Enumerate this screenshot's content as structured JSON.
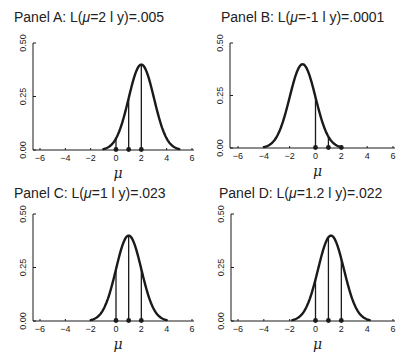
{
  "chart_data": [
    {
      "type": "line",
      "panel": "A",
      "title_prefix": "Panel A: L(",
      "title_mu": "μ",
      "title_suffix": "=2 l y)=.005",
      "mu": 2,
      "sigma": 1,
      "observations": [
        0,
        1,
        2
      ],
      "likelihood": ".005",
      "xlabel": "μ",
      "ylabel": "",
      "xlim": [
        -6,
        6
      ],
      "ylim": [
        0,
        0.5
      ],
      "xticks": [
        -6,
        -4,
        -2,
        0,
        2,
        4,
        6
      ],
      "yticks": [
        "0.00",
        "0.25",
        "0.50"
      ],
      "curve_range": [
        -1,
        5
      ]
    },
    {
      "type": "line",
      "panel": "B",
      "title_prefix": "Panel B: L(",
      "title_mu": "μ",
      "title_suffix": "=-1 l y)=.0001",
      "mu": -1,
      "sigma": 1,
      "observations": [
        0,
        1,
        2
      ],
      "likelihood": ".0001",
      "xlabel": "μ",
      "ylabel": "",
      "xlim": [
        -6,
        6
      ],
      "ylim": [
        0,
        0.5
      ],
      "xticks": [
        -6,
        -4,
        -2,
        0,
        2,
        4,
        6
      ],
      "yticks": [
        "0.00",
        "0.25",
        "0.50"
      ],
      "curve_range": [
        -4,
        2
      ]
    },
    {
      "type": "line",
      "panel": "C",
      "title_prefix": "Panel C: L(",
      "title_mu": "μ",
      "title_suffix": "=1 l y)=.023",
      "mu": 1,
      "sigma": 1,
      "observations": [
        0,
        1,
        2
      ],
      "likelihood": ".023",
      "xlabel": "μ",
      "ylabel": "",
      "xlim": [
        -6,
        6
      ],
      "ylim": [
        0,
        0.5
      ],
      "xticks": [
        -6,
        -4,
        -2,
        0,
        2,
        4,
        6
      ],
      "yticks": [
        "0.00",
        "0.25",
        "0.50"
      ],
      "curve_range": [
        -2,
        4
      ]
    },
    {
      "type": "line",
      "panel": "D",
      "title_prefix": "Panel D: L(",
      "title_mu": "μ",
      "title_suffix": "=1.2 l y)=.022",
      "mu": 1.2,
      "sigma": 1,
      "observations": [
        0,
        1,
        2
      ],
      "likelihood": ".022",
      "xlabel": "μ",
      "ylabel": "",
      "xlim": [
        -6,
        6
      ],
      "ylim": [
        0,
        0.5
      ],
      "xticks": [
        -6,
        -4,
        -2,
        0,
        2,
        4,
        6
      ],
      "yticks": [
        "0.00",
        "0.25",
        "0.50"
      ],
      "curve_range": [
        -1.8,
        4.2
      ]
    }
  ]
}
